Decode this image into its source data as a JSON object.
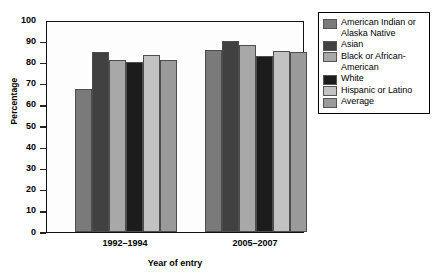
{
  "chart_data": {
    "type": "bar",
    "title": "",
    "xlabel": "Year of entry",
    "ylabel": "Percentage",
    "ylim": [
      0,
      100
    ],
    "ytick_values": [
      0,
      10,
      20,
      30,
      40,
      50,
      60,
      70,
      80,
      90,
      100
    ],
    "ytick_labels": [
      "0",
      "10",
      "20",
      "30",
      "40",
      "50",
      "60",
      "70",
      "80",
      "90",
      "100"
    ],
    "grid": false,
    "legend_position": "right",
    "categories": [
      "1992–1994",
      "2005–2007"
    ],
    "series": [
      {
        "name": "American Indian or Alaska Native",
        "color": "#7a7a7a",
        "values": [
          67.5,
          86
        ]
      },
      {
        "name": "Asian",
        "color": "#414141",
        "values": [
          85,
          90
        ]
      },
      {
        "name": "Black or African-American",
        "color": "#a8a8a8",
        "values": [
          81,
          88
        ]
      },
      {
        "name": "White",
        "color": "#1c1c1c",
        "values": [
          80,
          83
        ]
      },
      {
        "name": "Hispanic or Latino",
        "color": "#c2c2c2",
        "values": [
          83.5,
          85.5
        ]
      },
      {
        "name": "Average",
        "color": "#9a9a9a",
        "values": [
          81,
          85
        ]
      }
    ]
  },
  "legend": {
    "items": [
      {
        "label": "American Indian or Alaska Native",
        "color": "#7a7a7a"
      },
      {
        "label": "Asian",
        "color": "#414141"
      },
      {
        "label": "Black or African-American",
        "color": "#a8a8a8"
      },
      {
        "label": "White",
        "color": "#1c1c1c"
      },
      {
        "label": "Hispanic or Latino",
        "color": "#c2c2c2"
      },
      {
        "label": "Average",
        "color": "#9a9a9a"
      }
    ]
  }
}
